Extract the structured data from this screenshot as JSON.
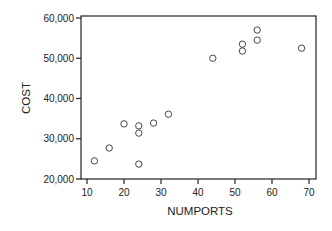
{
  "chart_data": {
    "type": "scatter",
    "title": "",
    "xlabel": "NUMPORTS",
    "ylabel": "COST",
    "xlim": [
      8,
      72
    ],
    "ylim": [
      20000,
      60000
    ],
    "x_ticks": [
      10,
      20,
      30,
      40,
      50,
      60,
      70
    ],
    "y_ticks": [
      20000,
      30000,
      40000,
      50000,
      60000
    ],
    "x_tick_labels": [
      "10",
      "20",
      "30",
      "40",
      "50",
      "60",
      "70"
    ],
    "y_tick_labels": [
      "20,000",
      "30,000",
      "40,000",
      "50,000",
      "60,000"
    ],
    "grid": false,
    "legend": null,
    "marker": "open-circle",
    "series": [
      {
        "name": "COST vs NUMPORTS",
        "points": [
          {
            "x": 12,
            "y": 24500
          },
          {
            "x": 16,
            "y": 27700
          },
          {
            "x": 20,
            "y": 33700
          },
          {
            "x": 24,
            "y": 33200
          },
          {
            "x": 24,
            "y": 31400
          },
          {
            "x": 24,
            "y": 23700
          },
          {
            "x": 28,
            "y": 33900
          },
          {
            "x": 32,
            "y": 36100
          },
          {
            "x": 44,
            "y": 50000
          },
          {
            "x": 52,
            "y": 53500
          },
          {
            "x": 52,
            "y": 51800
          },
          {
            "x": 56,
            "y": 57000
          },
          {
            "x": 56,
            "y": 54500
          },
          {
            "x": 68,
            "y": 52500
          }
        ]
      }
    ]
  }
}
